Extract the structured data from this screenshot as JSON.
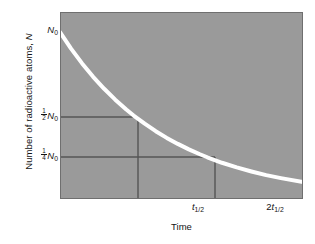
{
  "figure": {
    "background_color": "#ffffff",
    "panel_color": "#9a9a9a",
    "curve_color": "#ffffff",
    "guide_line_color": "#555555",
    "panel_border_color": "#6f6f6f"
  },
  "axes": {
    "y_title": "Number of radioactive atoms, N",
    "x_title": "Time",
    "y_ticks": [
      {
        "id": "n0",
        "label": "N0",
        "display_num": "",
        "display_den": "",
        "base": "N",
        "sub": "0"
      },
      {
        "id": "half",
        "label": "1/2 N0",
        "display_num": "1",
        "display_den": "2",
        "base": "N",
        "sub": "0"
      },
      {
        "id": "qtr",
        "label": "1/4 N0",
        "display_num": "1",
        "display_den": "4",
        "base": "N",
        "sub": "0"
      }
    ],
    "x_ticks": [
      {
        "id": "t1",
        "prefix": "",
        "base": "t",
        "sub": "1/2",
        "label": "t1/2"
      },
      {
        "id": "t2",
        "prefix": "2",
        "base": "t",
        "sub": "1/2",
        "label": "2t1/2"
      }
    ]
  },
  "chart_data": {
    "type": "line",
    "title": "",
    "subtitle": "",
    "xlabel": "Time",
    "ylabel": "Number of radioactive atoms, N",
    "xlim": [
      0,
      3.3
    ],
    "ylim": [
      0,
      1.12
    ],
    "grid": false,
    "legend": null,
    "x_tick_values": [
      1,
      2
    ],
    "x_tick_labels": [
      "t1/2",
      "2t1/2"
    ],
    "y_tick_values": [
      1.0,
      0.5,
      0.25
    ],
    "y_tick_labels": [
      "N0",
      "1/2 N0",
      "1/4 N0"
    ],
    "series": [
      {
        "name": "Radioactive decay N = N0 * (1/2)^(t/t_half)",
        "color": "#ffffff",
        "line_width_px": 4,
        "x": [
          0.0,
          0.15,
          0.3,
          0.45,
          0.6,
          0.75,
          0.9,
          1.0,
          1.15,
          1.3,
          1.45,
          1.6,
          1.75,
          1.9,
          2.0,
          2.2,
          2.4,
          2.6,
          2.8,
          3.0,
          3.3
        ],
        "y": [
          1.0,
          0.901,
          0.812,
          0.732,
          0.66,
          0.595,
          0.536,
          0.5,
          0.451,
          0.406,
          0.366,
          0.33,
          0.297,
          0.268,
          0.25,
          0.217,
          0.189,
          0.165,
          0.143,
          0.125,
          0.101
        ]
      }
    ],
    "annotations": [
      {
        "type": "hline",
        "y": 0.5,
        "x_from": 0.0,
        "x_to": 1.0,
        "color": "#555555",
        "note": "half of N0 guide"
      },
      {
        "type": "vline",
        "x": 1.0,
        "y_from": 0.0,
        "y_to": 0.5,
        "color": "#555555",
        "note": "t_half guide"
      },
      {
        "type": "hline",
        "y": 0.25,
        "x_from": 0.0,
        "x_to": 2.0,
        "color": "#555555",
        "note": "quarter of N0 guide"
      },
      {
        "type": "vline",
        "x": 2.0,
        "y_from": 0.0,
        "y_to": 0.25,
        "color": "#555555",
        "note": "2 t_half guide"
      }
    ]
  }
}
